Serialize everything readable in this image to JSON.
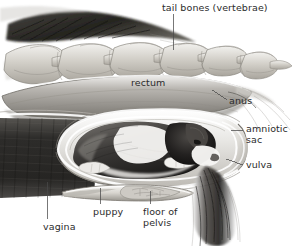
{
  "figure": {
    "kind": "anatomical-illustration",
    "background_color": "#ffffff",
    "label_color": "#2b2b2b",
    "leader_line_color": "#555555"
  },
  "labels": {
    "tail_bones": "tail bones (vertebrae)",
    "rectum": "rectum",
    "anus": "anus",
    "amniotic_sac": "amniotic\nsac",
    "vulva": "vulva",
    "vagina": "vagina",
    "puppy": "puppy",
    "floor_of_pelvis": "floor of\npelvis"
  },
  "structures": [
    {
      "name": "tail-fur",
      "description": "dark streaked fur above the tail base, upper left"
    },
    {
      "name": "tail-vertebrae",
      "description": "chain of six interlocking caudal vertebrae tapering to the right"
    },
    {
      "name": "rectum",
      "description": "long gray tube running beneath the vertebrae to the anus"
    },
    {
      "name": "anus",
      "description": "opening at the right end of the rectum"
    },
    {
      "name": "vaginal-wall",
      "description": "dark cross-hatched block of tissue at the left"
    },
    {
      "name": "amniotic-sac",
      "description": "translucent membrane enclosing the puppy, rounded at the vulva"
    },
    {
      "name": "puppy",
      "description": "black and white puppy, head directed right toward the vulva"
    },
    {
      "name": "vulva",
      "description": "external opening at the right of the birth canal"
    },
    {
      "name": "floor-of-pelvis",
      "description": "flat elongated pelvic bone below the birth canal"
    },
    {
      "name": "rear-fur",
      "description": "dark hanging fur tuft at the lower right"
    }
  ]
}
